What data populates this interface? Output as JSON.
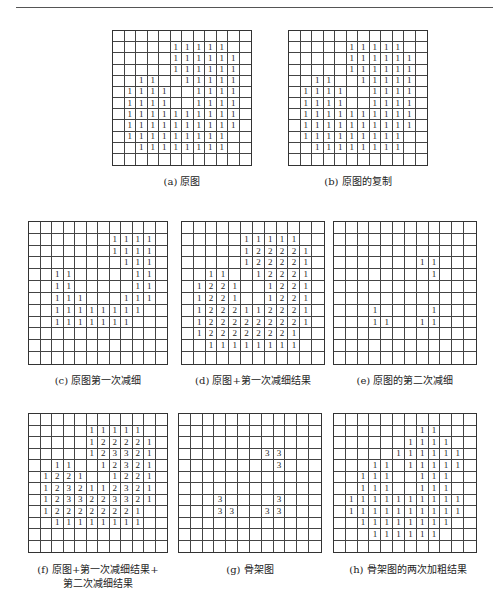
{
  "page": {
    "header_rule": true
  },
  "figures": [
    {
      "id": "a",
      "caption": "(a) 原图",
      "caption_lines": [
        "(a) 原图"
      ],
      "box": {
        "x": 112,
        "y": 30,
        "w": 140,
        "h": 136
      },
      "caption_pos": {
        "x": 112,
        "y": 175,
        "w": 140
      },
      "rows": [
        "            ",
        "     11111  ",
        "     111111 ",
        "     111111 ",
        "  11  11111 ",
        " 1111  1111 ",
        " 1111  1111 ",
        " 1111111111 ",
        " 1111111111 ",
        " 111111111  ",
        "  11111111  ",
        "            "
      ]
    },
    {
      "id": "b",
      "caption": "(b) 原图的复制",
      "caption_lines": [
        "(b) 原图的复制"
      ],
      "box": {
        "x": 288,
        "y": 30,
        "w": 140,
        "h": 136
      },
      "caption_pos": {
        "x": 288,
        "y": 175,
        "w": 140
      },
      "rows": [
        "            ",
        "     11111  ",
        "     111111 ",
        "     111111 ",
        "  11  11111 ",
        " 1111  1111 ",
        " 1111  1111 ",
        " 1111111111 ",
        " 1111111111 ",
        " 111111111  ",
        "  11111111  ",
        "            "
      ]
    },
    {
      "id": "c",
      "caption": "(c) 原图第一次减细",
      "caption_lines": [
        "(c) 原图第一次减细"
      ],
      "box": {
        "x": 28,
        "y": 221,
        "w": 140,
        "h": 144
      },
      "caption_pos": {
        "x": 28,
        "y": 374,
        "w": 140
      },
      "rows": [
        "            ",
        "       1111 ",
        "       1111 ",
        "        111 ",
        "  11     11 ",
        "  11     11 ",
        "  111   111 ",
        "  11111111  ",
        "  1111111   ",
        "            ",
        "            ",
        "            "
      ]
    },
    {
      "id": "d",
      "caption": "(d) 原图+第一次减细结果",
      "caption_lines": [
        "(d) 原图+第一次减细结果"
      ],
      "box": {
        "x": 181,
        "y": 221,
        "w": 144,
        "h": 144
      },
      "caption_pos": {
        "x": 175,
        "y": 374,
        "w": 156
      },
      "rows": [
        "            ",
        "     11111  ",
        "     122221 ",
        "     122221 ",
        "  11  12221 ",
        " 1221  1221 ",
        " 1221  1221 ",
        " 1222112221 ",
        " 1222222221 ",
        " 122222221  ",
        "  11111111  ",
        "            "
      ]
    },
    {
      "id": "e",
      "caption": "(e) 原图的第二次减细",
      "caption_lines": [
        "(e) 原图的第二次减细"
      ],
      "box": {
        "x": 333,
        "y": 221,
        "w": 144,
        "h": 144
      },
      "caption_pos": {
        "x": 333,
        "y": 374,
        "w": 144
      },
      "rows": [
        "            ",
        "            ",
        "            ",
        "       11   ",
        "        1   ",
        "            ",
        "            ",
        "   1    1   ",
        "   11  11   ",
        "            ",
        "            ",
        "            "
      ]
    },
    {
      "id": "f",
      "caption": "(f) 原图+第一次减细结果+第二次减细结果",
      "caption_lines": [
        "(f) 原图+第一次减细结果+",
        "第二次减细结果"
      ],
      "box": {
        "x": 28,
        "y": 413,
        "w": 140,
        "h": 140
      },
      "caption_pos": {
        "x": 20,
        "y": 563,
        "w": 156
      },
      "rows": [
        "            ",
        "     11111  ",
        "     122221 ",
        "     123321 ",
        "  11  12321 ",
        " 1221  1221 ",
        " 1232112321 ",
        " 1233223321 ",
        " 122222221  ",
        "  11111111  ",
        "            ",
        "            "
      ]
    },
    {
      "id": "g",
      "caption": "(g) 骨架图",
      "caption_lines": [
        "(g) 骨架图"
      ],
      "box": {
        "x": 178,
        "y": 413,
        "w": 144,
        "h": 140
      },
      "caption_pos": {
        "x": 178,
        "y": 563,
        "w": 144
      },
      "rows": [
        "            ",
        "            ",
        "            ",
        "       33   ",
        "        3   ",
        "            ",
        "            ",
        "   3    3   ",
        "   33  33   ",
        "            ",
        "            ",
        "            "
      ]
    },
    {
      "id": "h",
      "caption": "(h) 骨架图的两次加粗结果",
      "caption_lines": [
        "(h) 骨架图的两次加粗结果"
      ],
      "box": {
        "x": 333,
        "y": 413,
        "w": 144,
        "h": 140
      },
      "caption_pos": {
        "x": 330,
        "y": 563,
        "w": 156
      },
      "rows": [
        "            ",
        "       11   ",
        "      1111  ",
        "     111111 ",
        "   11 11111 ",
        "  111  111  ",
        "  111  111  ",
        " 1111111111 ",
        " 1111111111 ",
        "  11111111  ",
        "   111111   ",
        "            "
      ]
    }
  ]
}
